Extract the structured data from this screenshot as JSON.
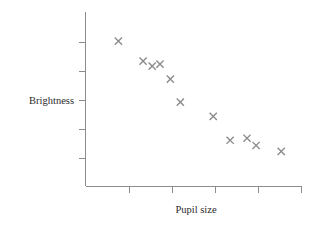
{
  "chart_data": {
    "type": "scatter",
    "title": "",
    "xlabel": "Pupil size",
    "ylabel": "Brightness",
    "grid": false,
    "legend": null,
    "xlim": [
      0,
      5
    ],
    "ylim": [
      0,
      6
    ],
    "xticks": [
      0,
      1,
      2,
      3,
      4,
      5
    ],
    "yticks": [
      1,
      2,
      3,
      4,
      5
    ],
    "xticklabels": [
      "",
      "",
      "",
      "",
      "",
      ""
    ],
    "yticklabels": [
      "",
      "",
      "",
      "",
      ""
    ],
    "marker": "x",
    "marker_color": "#8a8a8a",
    "axis_color": "#8c8c8c",
    "label_color": "#2b2b2b",
    "points": [
      {
        "x": 0.76,
        "y": 5.0
      },
      {
        "x": 1.33,
        "y": 4.31
      },
      {
        "x": 1.54,
        "y": 4.14
      },
      {
        "x": 1.96,
        "y": 3.69
      },
      {
        "x": 2.19,
        "y": 2.9
      },
      {
        "x": 2.95,
        "y": 2.41
      },
      {
        "x": 3.34,
        "y": 1.59
      },
      {
        "x": 3.73,
        "y": 1.66
      },
      {
        "x": 3.94,
        "y": 1.41
      },
      {
        "x": 4.52,
        "y": 1.21
      },
      {
        "x": 1.72,
        "y": 4.21
      }
    ]
  },
  "axes": {
    "y_axis_label": "Brightness",
    "x_axis_label": "Pupil size"
  }
}
